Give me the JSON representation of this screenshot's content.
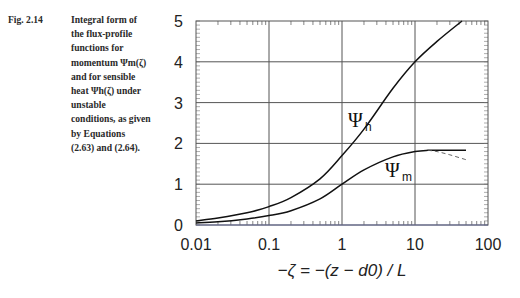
{
  "caption": {
    "figure_number": "Fig. 2.14",
    "lines": [
      "Integral form of",
      "the flux-profile",
      "functions for",
      "momentum Ψm(ζ)",
      "and for sensible",
      "heat Ψh(ζ) under",
      "unstable",
      "conditions, as given",
      "by Equations",
      "(2.63) and (2.64)."
    ]
  },
  "chart_data": {
    "type": "line",
    "title": "",
    "xlabel": "−ζ = −(z − d0) / L",
    "ylabel": "",
    "xscale": "log",
    "xlim": [
      0.01,
      100
    ],
    "ylim": [
      0,
      5
    ],
    "grid": true,
    "legend": "inline labels",
    "x_tick_labels": [
      "0.01",
      "0.1",
      "1",
      "10",
      "100"
    ],
    "y_tick_labels": [
      "0",
      "1",
      "2",
      "3",
      "4",
      "5"
    ],
    "series": [
      {
        "name": "Ψh",
        "label_main": "Ψ",
        "label_sub": "h",
        "style": "solid",
        "x": [
          0.01,
          0.02,
          0.05,
          0.1,
          0.2,
          0.5,
          1,
          2,
          5,
          10,
          20,
          44
        ],
        "values": [
          0.1,
          0.17,
          0.3,
          0.45,
          0.67,
          1.13,
          1.7,
          2.35,
          3.35,
          4.0,
          4.5,
          5.0
        ]
      },
      {
        "name": "Ψm",
        "label_main": "Ψ",
        "label_sub": "m",
        "style": "solid",
        "x": [
          0.01,
          0.02,
          0.05,
          0.1,
          0.2,
          0.5,
          1,
          2,
          5,
          10,
          15,
          20,
          50
        ],
        "values": [
          0.05,
          0.08,
          0.15,
          0.23,
          0.35,
          0.64,
          1.0,
          1.35,
          1.67,
          1.8,
          1.83,
          1.83,
          1.83
        ]
      },
      {
        "name": "Ψm (alternative, dashed)",
        "style": "dashed",
        "x": [
          15,
          20,
          30,
          50
        ],
        "values": [
          1.83,
          1.8,
          1.72,
          1.6
        ]
      }
    ]
  }
}
